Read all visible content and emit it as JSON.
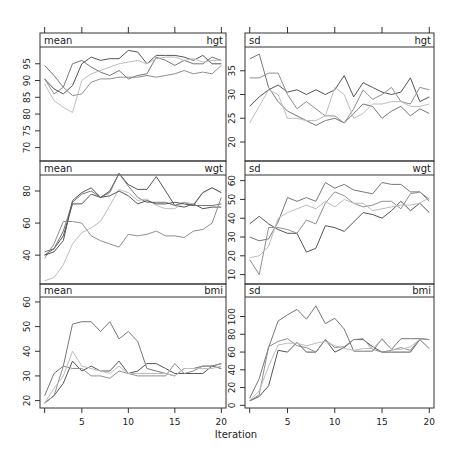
{
  "chart_data": {
    "type": "line",
    "title": "",
    "xlabel": "Iteration",
    "x": [
      1,
      2,
      3,
      4,
      5,
      6,
      7,
      8,
      9,
      10,
      11,
      12,
      13,
      14,
      15,
      16,
      17,
      18,
      19,
      20
    ],
    "x_ticks": [
      5,
      10,
      15,
      20
    ],
    "x_range": [
      0.5,
      20.5
    ],
    "grid": false,
    "series_colors": [
      "#555555",
      "#777777",
      "#8f8f8f",
      "#bdbdbd"
    ],
    "panels": [
      {
        "stat": "mean",
        "var": "hgt",
        "row": 0,
        "col": 0,
        "ylim": [
          66,
          100
        ],
        "y_ticks": [
          70,
          75,
          80,
          85,
          90,
          95
        ],
        "series": [
          {
            "name": "chain 1",
            "values": [
              90.5,
              87.5,
              86,
              88.5,
              95,
              97,
              96,
              96.5,
              96.5,
              99,
              98.5,
              95,
              97.5,
              97.5,
              97.5,
              97,
              96,
              97.5,
              95,
              95
            ]
          },
          {
            "name": "chain 2",
            "values": [
              94.5,
              91.5,
              88,
              95,
              96,
              94,
              92.5,
              91.5,
              93,
              90.5,
              91.5,
              92,
              97,
              96,
              94.5,
              96,
              95,
              95,
              97,
              96
            ]
          },
          {
            "name": "chain 3",
            "values": [
              90.5,
              86,
              88,
              85.5,
              86,
              89.5,
              90.5,
              90.5,
              91,
              91,
              91,
              91.5,
              91,
              91.5,
              92,
              93,
              92,
              92.5,
              92,
              94.5
            ]
          },
          {
            "name": "chain 4",
            "values": [
              89,
              84,
              82,
              80.5,
              90,
              92,
              93,
              94,
              95,
              95.5,
              96,
              95,
              96.5,
              97,
              97,
              96,
              96.5,
              95.5,
              96,
              96
            ]
          }
        ]
      },
      {
        "stat": "sd",
        "var": "hgt",
        "row": 0,
        "col": 1,
        "ylim": [
          16,
          40
        ],
        "y_ticks": [
          20,
          25,
          30,
          35
        ],
        "series": [
          {
            "name": "chain 1",
            "values": [
              27.5,
              29.5,
              31,
              32,
              30.5,
              31,
              30,
              31,
              30,
              31,
              34,
              29.5,
              32.5,
              31.5,
              30.5,
              30,
              30.5,
              33.5,
              28.5,
              29.5
            ]
          },
          {
            "name": "chain 2",
            "values": [
              37.5,
              38.5,
              31.5,
              28.5,
              26.5,
              25.5,
              24.5,
              23.5,
              24.5,
              25,
              24,
              26,
              28,
              27.5,
              25,
              26.5,
              27.5,
              25.5,
              27,
              26
            ]
          },
          {
            "name": "chain 3",
            "values": [
              33.5,
              33.5,
              34.5,
              34.5,
              30,
              27,
              28.5,
              27,
              25.5,
              25.5,
              24,
              27,
              31,
              29,
              30,
              31.5,
              28.5,
              28,
              31.5,
              31
            ]
          },
          {
            "name": "chain 4",
            "values": [
              24,
              27.5,
              31,
              30,
              25,
              25,
              24.5,
              24.5,
              25.5,
              31.5,
              30,
              25,
              26,
              28,
              28,
              28.5,
              28.5,
              27.5,
              27.5,
              28
            ]
          }
        ]
      },
      {
        "stat": "mean",
        "var": "wgt",
        "row": 1,
        "col": 0,
        "ylim": [
          22,
          90
        ],
        "y_ticks": [
          40,
          60,
          80
        ],
        "series": [
          {
            "name": "chain 1",
            "values": [
              40,
              44,
              52,
              72,
              72,
              78,
              76,
              80,
              91,
              84,
              81,
              81,
              89,
              80,
              71,
              70,
              72,
              69,
              70,
              70
            ]
          },
          {
            "name": "chain 2",
            "values": [
              42,
              44,
              55,
              73,
              78,
              80,
              76,
              79,
              91,
              83,
              76,
              73,
              73,
              73,
              71,
              73,
              71,
              71,
              71,
              72
            ]
          },
          {
            "name": "chain 3",
            "values": [
              38,
              47,
              61,
              61,
              60,
              52,
              49,
              47,
              45,
              53,
              52,
              53,
              55,
              52,
              52,
              51,
              55,
              56,
              60,
              76
            ]
          },
          {
            "name": "chain 4",
            "values": [
              24,
              26,
              34,
              47,
              54,
              57,
              61,
              71,
              81,
              79,
              74,
              75,
              71,
              69,
              69,
              73,
              72,
              79,
              82,
              79
            ]
          },
          {
            "name": "chain 5",
            "values": [
              40,
              42,
              49,
              74,
              79,
              82,
              76,
              77,
              80,
              77,
              72,
              74,
              72,
              72,
              73,
              72,
              71,
              79,
              82,
              79
            ]
          }
        ]
      },
      {
        "stat": "sd",
        "var": "wgt",
        "row": 1,
        "col": 1,
        "ylim": [
          5,
          63
        ],
        "y_ticks": [
          10,
          20,
          30,
          40,
          50,
          60
        ],
        "series": [
          {
            "name": "chain 1",
            "values": [
              37,
              41,
              37,
              34,
              32,
              32,
              22,
              24,
              36,
              35,
              33,
              38,
              43,
              42,
              40,
              44,
              49,
              44,
              48,
              43
            ]
          },
          {
            "name": "chain 2",
            "values": [
              30,
              28,
              29,
              38,
              51,
              49,
              51,
              49,
              59,
              56,
              58,
              55,
              54,
              53,
              59,
              58,
              58,
              54,
              54,
              50
            ]
          },
          {
            "name": "chain 3",
            "values": [
              18,
              10,
              35,
              35,
              34,
              32,
              39,
              37,
              48,
              54,
              52,
              48,
              46,
              47,
              49,
              49,
              45,
              53,
              54,
              49
            ]
          },
          {
            "name": "chain 4",
            "values": [
              19,
              20,
              25,
              40,
              43,
              45,
              47,
              45,
              49,
              46,
              50,
              48,
              48,
              44,
              45,
              46,
              47,
              47,
              48,
              51
            ]
          }
        ]
      },
      {
        "stat": "mean",
        "var": "bmi",
        "row": 2,
        "col": 0,
        "ylim": [
          17,
          62
        ],
        "y_ticks": [
          20,
          30,
          40,
          50,
          60
        ],
        "series": [
          {
            "name": "chain 1",
            "values": [
              19,
              22,
              27,
              36,
              32,
              34,
              32,
              32,
              36,
              31,
              32,
              35,
              35,
              33,
              31,
              31,
              31,
              31,
              34,
              33
            ]
          },
          {
            "name": "chain 2",
            "values": [
              22,
              31,
              34,
              51,
              52,
              52,
              48,
              52,
              45,
              48,
              44,
              33,
              32,
              31,
              30,
              33,
              33,
              34,
              34,
              35
            ]
          },
          {
            "name": "chain 3",
            "values": [
              19,
              22,
              34,
              33,
              33,
              30,
              30,
              29,
              32,
              31,
              30,
              30,
              30,
              30,
              35,
              31,
              32,
              34,
              34,
              35
            ]
          },
          {
            "name": "chain 4",
            "values": [
              19,
              25,
              30,
              40,
              34,
              33,
              32,
              31,
              34,
              31,
              31,
              31,
              31,
              31,
              30,
              33,
              33,
              33,
              33,
              34
            ]
          }
        ]
      },
      {
        "stat": "sd",
        "var": "bmi",
        "row": 2,
        "col": 1,
        "ylim": [
          -3,
          122
        ],
        "y_ticks": [
          0,
          20,
          40,
          60,
          80,
          100
        ],
        "series": [
          {
            "name": "chain 1",
            "values": [
              5,
              10,
              22,
              62,
              60,
              71,
              60,
              60,
              74,
              60,
              65,
              74,
              74,
              66,
              60,
              60,
              60,
              60,
              74,
              64
            ]
          },
          {
            "name": "chain 2",
            "values": [
              8,
              30,
              65,
              95,
              102,
              108,
              97,
              112,
              92,
              98,
              86,
              61,
              61,
              61,
              75,
              63,
              75,
              75,
              75,
              74
            ]
          },
          {
            "name": "chain 3",
            "values": [
              5,
              12,
              66,
              72,
              75,
              67,
              65,
              60,
              74,
              65,
              66,
              74,
              75,
              63,
              60,
              62,
              65,
              62,
              75,
              74
            ]
          },
          {
            "name": "chain 4",
            "values": [
              6,
              16,
              44,
              68,
              70,
              70,
              67,
              70,
              72,
              67,
              64,
              62,
              64,
              64,
              74,
              63,
              63,
              66,
              74,
              64
            ]
          }
        ]
      }
    ]
  }
}
